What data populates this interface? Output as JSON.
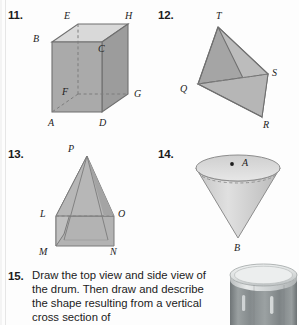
{
  "page": {
    "background": "#fdfdfd",
    "width": 299,
    "height": 325
  },
  "problems": [
    {
      "number": "11.",
      "figure": "rectangular-prism",
      "vertex_labels": [
        "E",
        "H",
        "B",
        "C",
        "F",
        "G",
        "A",
        "D"
      ],
      "fill_front": "#a9a9a9",
      "fill_side": "#9a9a9a",
      "fill_top": "#d8d8d8",
      "stroke": "#6e6e6e"
    },
    {
      "number": "12.",
      "figure": "tetrahedron",
      "vertex_labels": [
        "T",
        "S",
        "Q",
        "R"
      ],
      "fill_left": "#a3a3a3",
      "fill_right": "#bdbdbd",
      "fill_bottom": "#b5b5b5",
      "stroke": "#707070"
    },
    {
      "number": "13.",
      "figure": "pyramid-on-prism",
      "vertex_labels": [
        "P",
        "L",
        "O",
        "M",
        "N"
      ],
      "fill_front": "#b4b4b4",
      "fill_side": "#a6a6a6",
      "stroke": "#767676"
    },
    {
      "number": "14.",
      "figure": "inverted-cone",
      "vertex_labels": [
        "A",
        "B"
      ],
      "fill_body": "#d2d2d2",
      "fill_rim": "#c4c4c4",
      "stroke": "#8a8a8a"
    }
  ],
  "question15": {
    "number": "15.",
    "text": "Draw the top  view and side view of the drum. Then draw and describe the shape resulting from a vertical cross section of"
  },
  "drum": {
    "alt_label": "drum-photo",
    "body_color": "#8f9496",
    "rim_color": "#cfd2d3",
    "top_color": "#e8eaea"
  }
}
